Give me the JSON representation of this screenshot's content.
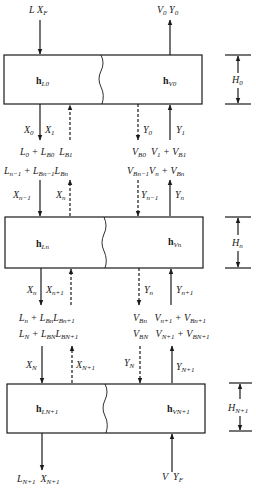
{
  "diagram": {
    "stages": [
      {
        "id": "stage-0",
        "liquid_enthalpy": {
          "base": "h",
          "sub": "L0"
        },
        "vapor_enthalpy": {
          "base": "h",
          "sub": "V0"
        },
        "height": {
          "base": "H",
          "sub": "0"
        }
      },
      {
        "id": "stage-n",
        "liquid_enthalpy": {
          "base": "h",
          "sub": "Ln"
        },
        "vapor_enthalpy": {
          "base": "h",
          "sub": "Vn"
        },
        "height": {
          "base": "H",
          "sub": "n"
        }
      },
      {
        "id": "stage-N+1",
        "liquid_enthalpy": {
          "base": "h",
          "sub": "LN+1"
        },
        "vapor_enthalpy": {
          "base": "h",
          "sub": "VN+1"
        },
        "height": {
          "base": "H",
          "sub": "N+1"
        }
      }
    ],
    "top_inputs": {
      "liquid_feed": {
        "a": "L",
        "b": "X",
        "b_sub": "F"
      },
      "vapor_out": {
        "a": "V",
        "a_sub": "0",
        "b": "Y",
        "b_sub": "0"
      }
    },
    "between_0_n": {
      "below_stage0_left": {
        "x_down": "X",
        "x_down_sub": "0",
        "x_up": "X",
        "x_up_sub": "1"
      },
      "below_stage0_right": {
        "y_down": "Y",
        "y_down_sub": "0",
        "y_up": "Y",
        "y_up_sub": "1"
      },
      "row1_left": [
        "L",
        "0",
        " + ",
        "L",
        "B0",
        "L",
        "B1"
      ],
      "row1_right": [
        "V",
        "B0",
        "V",
        "1",
        " + ",
        "V",
        "B1"
      ],
      "row2_left": [
        "L",
        "n−1",
        " + ",
        "L",
        "Bn−1",
        "L",
        "Bn"
      ],
      "row2_right": [
        "V",
        "Bn−1",
        "V",
        "n",
        " + ",
        "V",
        "Bn"
      ],
      "above_stagen_left": {
        "x_down": "X",
        "x_down_sub": "n−1",
        "x_up": "X",
        "x_up_sub": "n"
      },
      "above_stagen_right": {
        "y_down": "Y",
        "y_down_sub": "n−1",
        "y_up": "Y",
        "y_up_sub": "n"
      }
    },
    "between_n_N1": {
      "below_stagen_left": {
        "x_down": "X",
        "x_down_sub": "n",
        "x_up": "X",
        "x_up_sub": "n+1"
      },
      "below_stagen_right": {
        "y_down": "Y",
        "y_down_sub": "n",
        "y_up": "Y",
        "y_up_sub": "n+1"
      },
      "row1_left": [
        "L",
        "n",
        " + ",
        "L",
        "Bn",
        "L",
        "Bn+1"
      ],
      "row1_right": [
        "V",
        "Bn",
        "V",
        "n+1",
        " + ",
        "V",
        "Bn+1"
      ],
      "row2_left": [
        "L",
        "N",
        " + ",
        "L",
        "BN",
        "L",
        "BN+1"
      ],
      "row2_right": [
        "V",
        "BN",
        "V",
        "N+1",
        " + ",
        "V",
        "BN+1"
      ],
      "above_stageN1_left": {
        "x_down": "X",
        "x_down_sub": "N",
        "x_up": "X",
        "x_up_sub": "N+1"
      },
      "above_stageN1_right": {
        "y_down": "Y",
        "y_down_sub": "N",
        "y_up": "Y",
        "y_up_sub": "N+1"
      }
    },
    "bottom_outputs": {
      "liquid_out": {
        "a": "L",
        "a_sub": "N+1",
        "b": "X",
        "b_sub": "N+1"
      },
      "vapor_feed": {
        "a": "V",
        "b": "Y",
        "b_sub": "F"
      }
    }
  },
  "colors": {
    "line": "#1a1a1a",
    "background": "#ffffff"
  }
}
